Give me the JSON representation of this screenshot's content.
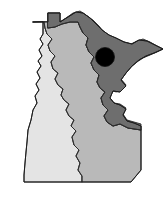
{
  "figure": {
    "name": "minnesota-state-map",
    "width": 168,
    "height": 206,
    "background_color": "#ffffff"
  },
  "colors": {
    "background": "#ffffff",
    "region_dark": "#6e6e6e",
    "region_mid": "#b9b9b9",
    "region_light": "#e4e4e4",
    "outline": "#1c1c1c",
    "inner_border": "#2b2b2b",
    "marker": "#000000"
  },
  "regions": [
    {
      "id": "north-east-dark",
      "label": "Northeast region",
      "shade": "dark",
      "fill": "#6e6e6e"
    },
    {
      "id": "south-east-mid",
      "label": "Southeast region",
      "shade": "medium",
      "fill": "#b9b9b9"
    },
    {
      "id": "west-light",
      "label": "Western region",
      "shade": "light",
      "fill": "#e4e4e4"
    }
  ],
  "marker": {
    "id": "location-dot",
    "label": "Location marker",
    "shape": "filled-circle",
    "color": "#000000",
    "center_x": 105,
    "center_y": 57,
    "radius": 9.5
  }
}
